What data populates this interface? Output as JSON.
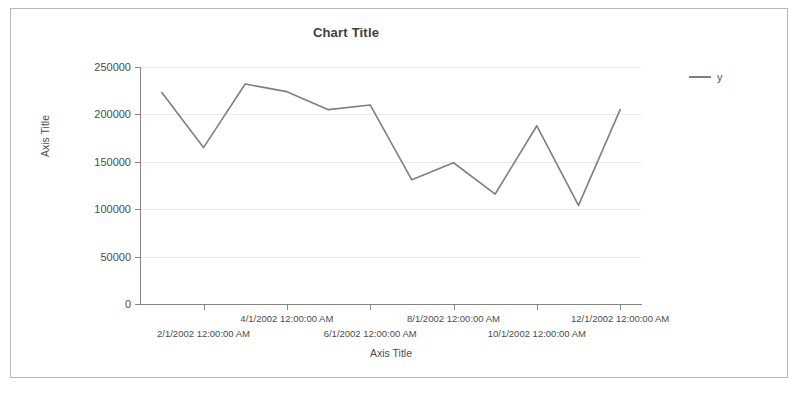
{
  "chart_data": {
    "type": "line",
    "title": "Chart Title",
    "xlabel": "Axis Title",
    "ylabel": "Axis Title",
    "ylim": [
      0,
      250000
    ],
    "ytick_labels": [
      "250000",
      "200000",
      "150000",
      "100000",
      "50000",
      "0"
    ],
    "ytick_values": [
      250000,
      200000,
      150000,
      100000,
      50000,
      0
    ],
    "grid": true,
    "legend_position": "right",
    "line_color": "#7f7f7f",
    "categories": [
      "1/1/2002 12:00:00 AM",
      "2/1/2002 12:00:00 AM",
      "3/1/2002 12:00:00 AM",
      "4/1/2002 12:00:00 AM",
      "5/1/2002 12:00:00 AM",
      "6/1/2002 12:00:00 AM",
      "7/1/2002 12:00:00 AM",
      "8/1/2002 12:00:00 AM",
      "9/1/2002 12:00:00 AM",
      "10/1/2002 12:00:00 AM",
      "11/1/2002 12:00:00 AM",
      "12/1/2002 12:00:00 AM"
    ],
    "xtick_labels": [
      "2/1/2002 12:00:00 AM",
      "4/1/2002 12:00:00 AM",
      "6/1/2002 12:00:00 AM",
      "8/1/2002 12:00:00 AM",
      "10/1/2002 12:00:00 AM",
      "12/1/2002 12:00:00 AM"
    ],
    "series": [
      {
        "name": "y",
        "values": [
          223000,
          165000,
          232000,
          224000,
          205000,
          210000,
          131000,
          149000,
          116000,
          188000,
          104000,
          205000
        ]
      }
    ]
  },
  "legend": {
    "entries": [
      {
        "label": "y",
        "color": "#7f7f7f"
      }
    ]
  }
}
